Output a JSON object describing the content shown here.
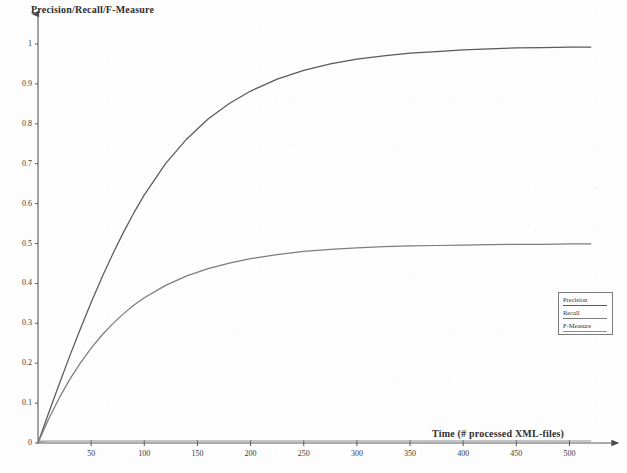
{
  "chart_data": {
    "type": "line",
    "title": "",
    "xlabel": "Time (# processed XML-files)",
    "ylabel": "Precision/Recall/F-Measure",
    "xlim": [
      0,
      540
    ],
    "ylim": [
      0,
      1.0
    ],
    "grid": false,
    "legend_position": "lower-right",
    "x_ticks": [
      "50",
      "100",
      "150",
      "200",
      "250",
      "300",
      "350",
      "400",
      "450",
      "500"
    ],
    "x_tick_values": [
      50,
      100,
      150,
      200,
      250,
      300,
      350,
      400,
      450,
      500
    ],
    "y_ticks": [
      "0",
      "0.1",
      "0.2",
      "0.3",
      "0.4",
      "0.5",
      "0.6",
      "0.7",
      "0.8",
      "0.9",
      "1"
    ],
    "y_tick_values": [
      0,
      0.1,
      0.2,
      0.3,
      0.4,
      0.5,
      0.6,
      0.7,
      0.8,
      0.9,
      1.0
    ],
    "x": [
      0,
      10,
      20,
      30,
      40,
      50,
      60,
      70,
      80,
      90,
      100,
      120,
      140,
      160,
      180,
      200,
      225,
      250,
      275,
      300,
      325,
      350,
      375,
      400,
      425,
      450,
      475,
      500,
      520
    ],
    "series": [
      {
        "name": "Precision",
        "color": "#5a5a5a",
        "values": [
          0.0,
          0.075,
          0.148,
          0.219,
          0.287,
          0.352,
          0.414,
          0.472,
          0.526,
          0.576,
          0.622,
          0.7,
          0.762,
          0.812,
          0.851,
          0.882,
          0.912,
          0.934,
          0.95,
          0.962,
          0.97,
          0.977,
          0.981,
          0.985,
          0.988,
          0.99,
          0.991,
          0.992,
          0.992
        ]
      },
      {
        "name": "Recall",
        "color": "#7d7d7d",
        "values": [
          0.0,
          0.06,
          0.113,
          0.16,
          0.201,
          0.238,
          0.27,
          0.298,
          0.323,
          0.345,
          0.364,
          0.395,
          0.419,
          0.437,
          0.451,
          0.462,
          0.472,
          0.48,
          0.485,
          0.489,
          0.492,
          0.494,
          0.495,
          0.496,
          0.497,
          0.498,
          0.498,
          0.499,
          0.499
        ]
      },
      {
        "name": "F-Measure",
        "color": "#8d8d8d",
        "values": [
          0.004,
          0.005,
          0.005,
          0.005,
          0.005,
          0.005,
          0.005,
          0.005,
          0.005,
          0.005,
          0.005,
          0.005,
          0.005,
          0.005,
          0.005,
          0.005,
          0.005,
          0.005,
          0.005,
          0.005,
          0.005,
          0.005,
          0.005,
          0.005,
          0.005,
          0.005,
          0.005,
          0.005,
          0.005
        ]
      }
    ]
  },
  "legend": {
    "items": [
      {
        "label": "Precision"
      },
      {
        "label": "Recall"
      },
      {
        "label": "F-Measure"
      }
    ]
  },
  "axes": {
    "y_title": "Precision/Recall/F-Measure",
    "x_title": "Time (# processed XML-files)"
  }
}
